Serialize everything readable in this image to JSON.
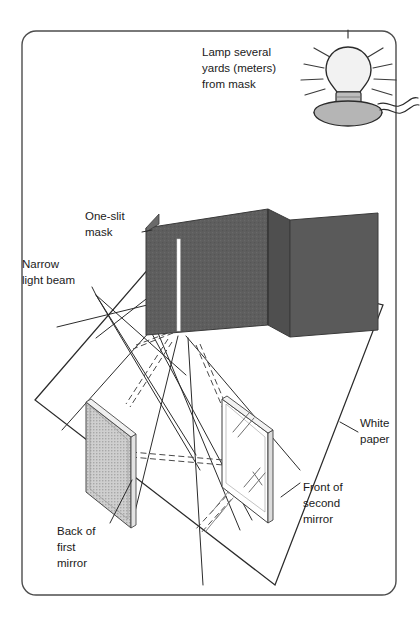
{
  "figure": {
    "border_color": "#4d4d4d",
    "line_color": "#2b2b2b",
    "mask_color": "#5e5e5e",
    "mirror_back_color": "#c9c9c9",
    "mirror_front_color": "#ffffff",
    "lamp_base_color": "#b5b5b5",
    "bulb_color": "#f2f2f2"
  },
  "labels": {
    "lamp": {
      "line1": "Lamp several",
      "line2": "yards (meters)",
      "line3": "from mask"
    },
    "mask": {
      "line1": "One-slit",
      "line2": "mask"
    },
    "beam": {
      "line1": "Narrow",
      "line2": "light beam"
    },
    "paper": {
      "line1": "White",
      "line2": "paper"
    },
    "first_mirror": {
      "line1": "Back of",
      "line2": "first",
      "line3": "mirror"
    },
    "second_mirror": {
      "line1": "Front of",
      "line2": "second",
      "line3": "mirror"
    }
  },
  "parts": {
    "lamp_icon": "light-bulb-lamp",
    "mask_icon": "folded-slit-mask",
    "first_mirror_icon": "mirror-back-stippled",
    "second_mirror_icon": "mirror-front-clear",
    "paper_icon": "white-paper-sheet",
    "beam_solid_icon": "light-ray-solid",
    "beam_dashed_icon": "light-ray-dashed"
  }
}
